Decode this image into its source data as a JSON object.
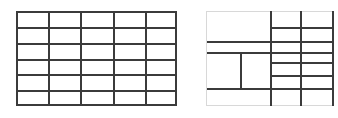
{
  "page": {
    "background_color": "#ffffff",
    "width": 338,
    "height": 118
  },
  "style": {
    "rule_color": "#3b3b3b",
    "light_rule_color": "#d8d8d8",
    "cell_fill": "#ffffff",
    "rule_thickness_px": 2,
    "light_rule_thickness_px": 1
  },
  "figures": [
    {
      "id": "left-grid",
      "label": "regular-grid",
      "description": "Uniform table grid with 5 equal columns and 6 equal rows, all rules drawn dark and full length.",
      "origin": {
        "x": 16,
        "y": 11
      },
      "size": {
        "width": 161,
        "height": 95
      },
      "columns": 5,
      "rows": 6,
      "border": "full",
      "column_x": [
        0,
        32,
        64,
        97,
        129,
        161
      ],
      "row_y": [
        0,
        16,
        32,
        48,
        63,
        79,
        95
      ],
      "merged_cells": [],
      "rules": {
        "horizontal": [
          {
            "y": 0,
            "x1": 0,
            "x2": 161,
            "weight": "dark"
          },
          {
            "y": 16,
            "x1": 0,
            "x2": 161,
            "weight": "dark"
          },
          {
            "y": 32,
            "x1": 0,
            "x2": 161,
            "weight": "dark"
          },
          {
            "y": 48,
            "x1": 0,
            "x2": 161,
            "weight": "dark"
          },
          {
            "y": 63,
            "x1": 0,
            "x2": 161,
            "weight": "dark"
          },
          {
            "y": 79,
            "x1": 0,
            "x2": 161,
            "weight": "dark"
          },
          {
            "y": 93,
            "x1": 0,
            "x2": 161,
            "weight": "dark"
          }
        ],
        "vertical": [
          {
            "x": 0,
            "y1": 0,
            "y2": 95,
            "weight": "dark"
          },
          {
            "x": 32,
            "y1": 0,
            "y2": 95,
            "weight": "dark"
          },
          {
            "x": 64,
            "y1": 0,
            "y2": 95,
            "weight": "dark"
          },
          {
            "x": 97,
            "y1": 0,
            "y2": 95,
            "weight": "dark"
          },
          {
            "x": 129,
            "y1": 0,
            "y2": 95,
            "weight": "dark"
          },
          {
            "x": 159,
            "y1": 0,
            "y2": 95,
            "weight": "dark"
          }
        ]
      }
    },
    {
      "id": "right-grid",
      "label": "irregular-grid",
      "description": "Irregular table with spanning cells: a large empty block top-left, partial horizontal rules, a short vertical stub in the lower-left band, and a denser regular lattice on the right third. Outer frame drawn in light gray.",
      "origin": {
        "x": 206,
        "y": 11
      },
      "size": {
        "width": 127,
        "height": 95
      },
      "border": "light",
      "column_x": [
        0,
        34,
        64,
        94,
        126
      ],
      "row_y": [
        0,
        30,
        41,
        51,
        64,
        77,
        95
      ],
      "merged_cells": [
        {
          "label": "top-left-span",
          "col_start": 0,
          "col_end": 2,
          "row_start": 0,
          "row_end": 1
        },
        {
          "label": "mid-left-span",
          "col_start": 0,
          "col_end": 2,
          "row_start": 2,
          "row_end": 3
        },
        {
          "label": "bottom-band-span",
          "col_start": 0,
          "col_end": 4,
          "row_start": 5,
          "row_end": 6
        }
      ],
      "rules": {
        "horizontal": [
          {
            "y": 0,
            "x1": 0,
            "x2": 127,
            "weight": "light"
          },
          {
            "y": 16,
            "x1": 64,
            "x2": 127,
            "weight": "dark"
          },
          {
            "y": 30,
            "x1": 0,
            "x2": 127,
            "weight": "dark"
          },
          {
            "y": 41,
            "x1": 0,
            "x2": 127,
            "weight": "dark"
          },
          {
            "y": 51,
            "x1": 64,
            "x2": 127,
            "weight": "dark"
          },
          {
            "y": 64,
            "x1": 64,
            "x2": 127,
            "weight": "dark"
          },
          {
            "y": 77,
            "x1": 0,
            "x2": 127,
            "weight": "dark"
          },
          {
            "y": 94,
            "x1": 0,
            "x2": 127,
            "weight": "light"
          }
        ],
        "vertical": [
          {
            "x": 0,
            "y1": 0,
            "y2": 95,
            "weight": "light"
          },
          {
            "x": 34,
            "y1": 41,
            "y2": 79,
            "weight": "dark"
          },
          {
            "x": 64,
            "y1": 0,
            "y2": 95,
            "weight": "dark"
          },
          {
            "x": 94,
            "y1": 0,
            "y2": 95,
            "weight": "dark"
          },
          {
            "x": 126,
            "y1": 0,
            "y2": 95,
            "weight": "dark"
          }
        ]
      }
    }
  ]
}
